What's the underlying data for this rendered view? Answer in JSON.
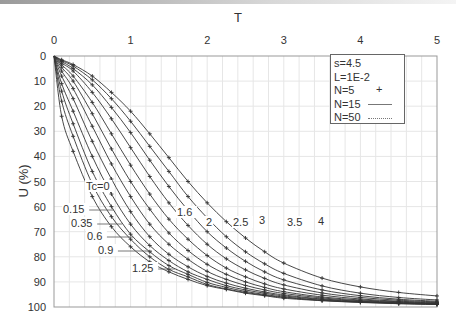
{
  "chart_data": {
    "type": "line",
    "title": "",
    "xlabel": "T",
    "ylabel": "U (%)",
    "xlim": [
      0,
      5
    ],
    "ylim": [
      0,
      100
    ],
    "y_inverted": true,
    "x_axis_position": "top",
    "x_ticks": [
      "0",
      "1",
      "2",
      "3",
      "4",
      "5"
    ],
    "y_ticks": [
      "0",
      "10",
      "20",
      "30",
      "40",
      "50",
      "60",
      "70",
      "80",
      "90",
      "100"
    ],
    "grid": true,
    "legend": {
      "position": "top-right",
      "entries": [
        "s=4.5",
        "L=1E-2",
        "N=5",
        "N=15",
        "N=50"
      ],
      "symbols": [
        "",
        "",
        "+",
        "solid",
        "dashed"
      ]
    },
    "x": [
      0,
      0.1,
      0.25,
      0.5,
      0.75,
      1.0,
      1.25,
      1.5,
      1.75,
      2.0,
      2.25,
      2.5,
      2.75,
      3.0,
      3.5,
      4.0,
      4.5,
      5.0
    ],
    "series": [
      {
        "name": "Tc=0",
        "label": "Tc=0",
        "values": [
          0,
          24,
          38,
          56,
          68,
          76,
          82,
          86,
          89,
          91.5,
          93,
          94.5,
          95.5,
          96.5,
          97.5,
          98.2,
          98.7,
          99
        ]
      },
      {
        "name": "Tc=0.15",
        "label": "0.15",
        "values": [
          0,
          18,
          32,
          51,
          64,
          73,
          80,
          85,
          88,
          91,
          92.8,
          94.2,
          95.3,
          96.2,
          97.4,
          98.1,
          98.6,
          99
        ]
      },
      {
        "name": "Tc=0.35",
        "label": "0.35",
        "values": [
          0,
          14,
          27,
          46,
          60,
          71,
          78,
          83.5,
          87,
          90.2,
          92.2,
          93.8,
          95,
          96,
          97.3,
          98,
          98.5,
          98.9
        ]
      },
      {
        "name": "Tc=0.6",
        "label": "0.6",
        "values": [
          0,
          11,
          22,
          40,
          55,
          67,
          75.5,
          81.5,
          86,
          89,
          91.5,
          93.2,
          94.5,
          95.6,
          97,
          97.9,
          98.4,
          98.8
        ]
      },
      {
        "name": "Tc=0.9",
        "label": "0.9",
        "values": [
          0,
          8,
          17,
          34,
          49,
          62,
          72,
          79,
          84,
          87.8,
          90.5,
          92.5,
          94,
          95.2,
          96.8,
          97.7,
          98.3,
          98.7
        ]
      },
      {
        "name": "Tc=1.25",
        "label": "1.25",
        "values": [
          0,
          6,
          13,
          28,
          43,
          56,
          67,
          75,
          81,
          85.8,
          89,
          91.4,
          93.2,
          94.6,
          96.4,
          97.5,
          98.1,
          98.6
        ]
      },
      {
        "name": "Tc=1.6",
        "label": "1.6",
        "values": [
          0,
          4.5,
          10,
          23,
          37,
          50,
          61,
          70.5,
          77.5,
          83,
          87,
          90,
          92.2,
          93.9,
          96,
          97.2,
          97.9,
          98.4
        ]
      },
      {
        "name": "Tc=2",
        "label": "2",
        "values": [
          0,
          3.5,
          8,
          18.5,
          31,
          43.5,
          55,
          65,
          73,
          79.5,
          84.5,
          88,
          90.8,
          92.8,
          95.3,
          96.8,
          97.7,
          98.2
        ]
      },
      {
        "name": "Tc=2.5",
        "label": "2.5",
        "values": [
          0,
          2.8,
          6,
          14.5,
          25,
          36.5,
          48,
          58.5,
          67.5,
          75,
          80.8,
          85.2,
          88.6,
          91.2,
          94.4,
          96.2,
          97.3,
          98
        ]
      },
      {
        "name": "Tc=3",
        "label": "3",
        "values": [
          0,
          2.2,
          5,
          11.5,
          20.5,
          30.5,
          41.5,
          52,
          61.5,
          70,
          76.5,
          81.8,
          86,
          89.2,
          93.2,
          95.5,
          96.9,
          97.7
        ]
      },
      {
        "name": "Tc=3.5",
        "label": "3.5",
        "values": [
          0,
          1.8,
          4,
          9.5,
          17,
          26,
          36,
          46,
          56,
          64.5,
          72,
          78,
          82.8,
          86.6,
          91.6,
          94.5,
          96.2,
          97.2
        ]
      },
      {
        "name": "Tc=4",
        "label": "4",
        "values": [
          0,
          1.5,
          3.4,
          8,
          14.5,
          22,
          31,
          40.5,
          50,
          58.5,
          66,
          72.5,
          78,
          82.5,
          88.5,
          92,
          94.2,
          95.6
        ]
      }
    ],
    "annotations": [
      {
        "text": "Tc=0",
        "x_px": 86,
        "y_px": 190
      },
      {
        "text": "0.15",
        "x_px": 63,
        "y_px": 213
      },
      {
        "text": "0.35",
        "x_px": 71,
        "y_px": 227
      },
      {
        "text": "0.6",
        "x_px": 87,
        "y_px": 240
      },
      {
        "text": "0.9",
        "x_px": 98,
        "y_px": 254
      },
      {
        "text": "1.25",
        "x_px": 132,
        "y_px": 272
      },
      {
        "text": "1.6",
        "x_px": 177,
        "y_px": 216
      },
      {
        "text": "2",
        "x_px": 206,
        "y_px": 226
      },
      {
        "text": "2.5",
        "x_px": 233,
        "y_px": 226
      },
      {
        "text": "3",
        "x_px": 259,
        "y_px": 224
      },
      {
        "text": "3.5",
        "x_px": 287,
        "y_px": 226
      },
      {
        "text": "4",
        "x_px": 318,
        "y_px": 225
      }
    ],
    "leaders": [
      {
        "from": [
          99,
          187
        ],
        "to": [
          110,
          187
        ]
      },
      {
        "from": [
          87,
          210
        ],
        "to": [
          114,
          210
        ]
      },
      {
        "from": [
          94,
          224
        ],
        "to": [
          122,
          224
        ]
      },
      {
        "from": [
          105,
          237
        ],
        "to": [
          133,
          237
        ]
      },
      {
        "from": [
          117,
          251
        ],
        "to": [
          152,
          251
        ]
      },
      {
        "from": [
          155,
          269
        ],
        "to": [
          175,
          269
        ]
      }
    ]
  },
  "legend_text": {
    "s": "s=4.5",
    "L": "L=1E-2",
    "n5": "N=5",
    "n15": "N=15",
    "n50": "N=50"
  },
  "axes": {
    "x_title": "T",
    "y_title": "U (%)"
  },
  "colors": {
    "curve": "#333333",
    "grid": "#e6e6e6",
    "axis": "#999999"
  }
}
